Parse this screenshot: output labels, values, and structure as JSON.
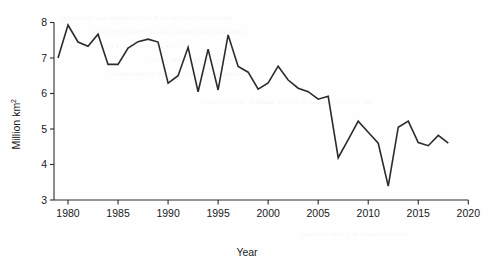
{
  "chart_data": {
    "type": "line",
    "title": "",
    "xlabel": "Year",
    "ylabel": "Million km",
    "ylabel_sup": "2",
    "xlim": [
      1978,
      2020
    ],
    "ylim": [
      3,
      8
    ],
    "grid": false,
    "legend": "none",
    "x_ticks": [
      1980,
      1985,
      1990,
      1995,
      2000,
      2005,
      2010,
      2015,
      2020
    ],
    "y_ticks": [
      3,
      4,
      5,
      6,
      7,
      8
    ],
    "series": [
      {
        "name": "Arctic sea ice extent",
        "color": "#2b2b2b",
        "x": [
          1979,
          1980,
          1981,
          1982,
          1983,
          1984,
          1985,
          1986,
          1987,
          1988,
          1989,
          1990,
          1991,
          1992,
          1993,
          1994,
          1995,
          1996,
          1997,
          1998,
          1999,
          2000,
          2001,
          2002,
          2003,
          2004,
          2005,
          2006,
          2007,
          2008,
          2009,
          2010,
          2011,
          2012,
          2013,
          2014,
          2015,
          2016,
          2017,
          2018
        ],
        "y": [
          7.0,
          7.93,
          7.45,
          7.33,
          7.67,
          6.82,
          6.82,
          7.28,
          7.46,
          7.53,
          7.45,
          6.29,
          6.5,
          7.3,
          6.05,
          7.25,
          6.1,
          7.65,
          6.76,
          6.6,
          6.12,
          6.3,
          6.77,
          6.38,
          6.15,
          6.05,
          5.84,
          5.92,
          4.19,
          4.7,
          5.22,
          4.91,
          4.6,
          3.39,
          5.05,
          5.22,
          4.62,
          4.53,
          4.82,
          4.6
        ]
      }
    ]
  },
  "bleed_through_text": [
    "the overall decline in Arctic summer sea ice extent",
    "satellite observations record since 1979 show",
    "has continued at a rate of about",
    "per decade in recent years",
    "minimum extent occurred in September"
  ]
}
